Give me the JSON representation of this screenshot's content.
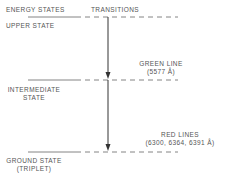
{
  "headers": {
    "energy_states": "ENERGY STATES",
    "transitions": "TRANSITIONS"
  },
  "states": [
    {
      "label_line1": "UPPER STATE",
      "label_line2": ""
    },
    {
      "label_line1": "INTERMEDIATE",
      "label_line2": "STATE"
    },
    {
      "label_line1": "GROUND STATE",
      "label_line2": "(TRIPLET)"
    }
  ],
  "transitions": [
    {
      "label_line1": "GREEN LINE",
      "label_line2": "(5577 Å)"
    },
    {
      "label_line1": "RED LINES",
      "label_line2": "(6300, 6364, 6391 Å)"
    }
  ],
  "colors": {
    "line": "#444444",
    "text": "#555555"
  }
}
